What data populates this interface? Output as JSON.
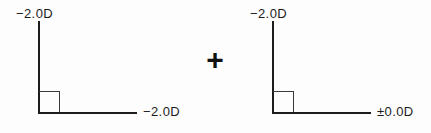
{
  "figure": {
    "type": "optical-power-cross-diagram",
    "background_color": "#fdfdfd",
    "line_color": "#1c1c1c",
    "operator": "+",
    "crosses": [
      {
        "id": "cross-left",
        "vertical_label": "−2.0D",
        "horizontal_label": "−2.0D"
      },
      {
        "id": "cross-right",
        "vertical_label": "−2.0D",
        "horizontal_label": "±0.0D"
      }
    ]
  }
}
